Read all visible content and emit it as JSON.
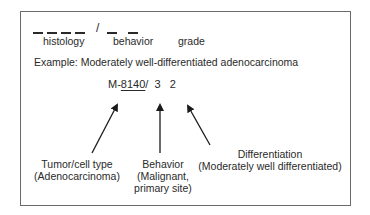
{
  "template": {
    "blanks_histology_count": 4,
    "separator": "/",
    "blanks_after_separator_count": 2,
    "labels": {
      "histology": "histology",
      "behavior": "behavior",
      "grade": "grade"
    }
  },
  "example": {
    "caption": "Example: Moderately well-differentiated adenocarcinoma",
    "code_prefix": "M-",
    "code_histology": "8140",
    "code_separator": "/",
    "code_behavior": "3",
    "code_grade": "2"
  },
  "annotations": [
    {
      "id": "tumor",
      "line1": "Tumor/cell type",
      "line2": "(Adenocarcinoma)"
    },
    {
      "id": "behavior",
      "line1": "Behavior",
      "line2": "(Malignant,",
      "line3": "primary site)"
    },
    {
      "id": "differentiation",
      "line1": "Differentiation",
      "line2": "(Moderately well differentiated)"
    }
  ],
  "colors": {
    "text": "#2a2a2a",
    "border": "#6a6a6a",
    "arrow": "#1a1a1a"
  }
}
